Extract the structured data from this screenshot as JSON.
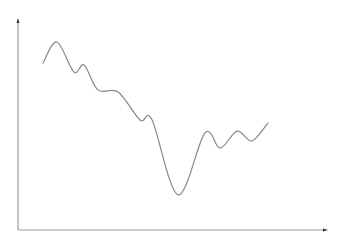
{
  "chart_data": {
    "type": "line",
    "title": "",
    "xlabel": "",
    "ylabel": "",
    "xlim": [
      0,
      100
    ],
    "ylim": [
      0,
      100
    ],
    "grid": false,
    "legend": null,
    "axis_arrows": true,
    "series": [
      {
        "name": "series",
        "color": "#888888",
        "x": [
          8.1,
          12.6,
          18.1,
          21.4,
          25.9,
          32.4,
          39.5,
          43.4,
          51.8,
          60.5,
          65.4,
          70.9,
          75.7,
          80.9
        ],
        "values": [
          79.5,
          89.5,
          75.2,
          78.6,
          66.7,
          65.7,
          52.4,
          52.4,
          16.7,
          46.2,
          39.0,
          47.1,
          42.4,
          51.0
        ]
      }
    ]
  },
  "colors": {
    "axis": "#999999",
    "arrow": "#333333",
    "line": "#888888",
    "background": "#ffffff"
  }
}
